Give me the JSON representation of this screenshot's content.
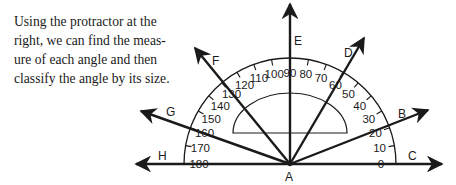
{
  "intro": {
    "lines": [
      "Using the protractor at the",
      "right, we can find the meas-",
      "ure of each angle and then",
      "classify the angle by its size."
    ]
  },
  "diagram": {
    "vertex_label": "A",
    "rays": [
      {
        "label": "C",
        "angle": 0
      },
      {
        "label": "B",
        "angle": 20
      },
      {
        "label": "D",
        "angle": 60
      },
      {
        "label": "E",
        "angle": 90
      },
      {
        "label": "F",
        "angle": 125
      },
      {
        "label": "G",
        "angle": 160
      },
      {
        "label": "H",
        "angle": 180
      }
    ],
    "scale_labels": [
      "0",
      "10",
      "20",
      "30",
      "40",
      "50",
      "60",
      "70",
      "80",
      "90",
      "100",
      "110",
      "120",
      "130",
      "140",
      "150",
      "160",
      "170",
      "180"
    ],
    "stroke_color": "#1a1a1a",
    "background": "#ffffff"
  }
}
